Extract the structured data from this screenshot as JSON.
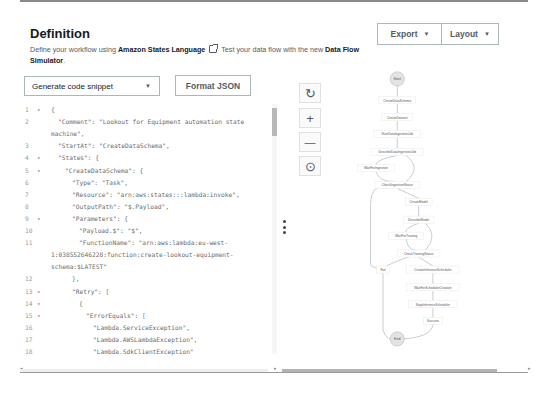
{
  "header": {
    "title": "Definition",
    "description_prefix": "Define your workflow using ",
    "description_link": "Amazon States Language",
    "description_mid": " Test your data flow with the new ",
    "description_bold2": "Data Flow Simulator",
    "description_suffix": ".",
    "export_label": "Export",
    "layout_label": "Layout"
  },
  "toolbar": {
    "snippet_select": "Generate code snippet",
    "format_json_label": "Format JSON"
  },
  "editor": {
    "lines": [
      {
        "n": "1",
        "fold": true,
        "indent": 0,
        "text": "{"
      },
      {
        "n": "2",
        "fold": false,
        "indent": 1,
        "text": "\"Comment\": \"Lookout for Equipment automation state"
      },
      {
        "n": "",
        "fold": false,
        "indent": 0,
        "text": "machine\","
      },
      {
        "n": "3",
        "fold": false,
        "indent": 1,
        "text": "\"StartAt\": \"CreateDataSchema\","
      },
      {
        "n": "4",
        "fold": true,
        "indent": 1,
        "text": "\"States\": {"
      },
      {
        "n": "5",
        "fold": true,
        "indent": 2,
        "text": "\"CreateDataSchema\": {"
      },
      {
        "n": "6",
        "fold": false,
        "indent": 3,
        "text": "\"Type\": \"Task\","
      },
      {
        "n": "7",
        "fold": false,
        "indent": 3,
        "text": "\"Resource\": \"arn:aws:states:::lambda:invoke\","
      },
      {
        "n": "8",
        "fold": false,
        "indent": 3,
        "text": "\"OutputPath\": \"$.Payload\","
      },
      {
        "n": "9",
        "fold": true,
        "indent": 3,
        "text": "\"Parameters\": {"
      },
      {
        "n": "10",
        "fold": false,
        "indent": 4,
        "text": "\"Payload.$\": \"$\","
      },
      {
        "n": "11",
        "fold": false,
        "indent": 4,
        "text": "\"FunctionName\": \"arn:aws:lambda:eu-west-"
      },
      {
        "n": "",
        "fold": false,
        "indent": 0,
        "text": "1:038552646228:function:create-lookout-equipment-"
      },
      {
        "n": "",
        "fold": false,
        "indent": 0,
        "text": "schema:$LATEST\""
      },
      {
        "n": "12",
        "fold": false,
        "indent": 3,
        "text": "},"
      },
      {
        "n": "13",
        "fold": true,
        "indent": 3,
        "text": "\"Retry\": ["
      },
      {
        "n": "14",
        "fold": true,
        "indent": 4,
        "text": "{"
      },
      {
        "n": "15",
        "fold": true,
        "indent": 5,
        "text": "\"ErrorEquals\": ["
      },
      {
        "n": "16",
        "fold": false,
        "indent": 6,
        "text": "\"Lambda.ServiceException\","
      },
      {
        "n": "17",
        "fold": false,
        "indent": 6,
        "text": "\"Lambda.AWSLambdaException\","
      },
      {
        "n": "18",
        "fold": false,
        "indent": 6,
        "text": "\"Lambda.SdkClientException\""
      },
      {
        "n": "19",
        "fold": false,
        "indent": 5,
        "text": "],"
      }
    ]
  },
  "graph_controls": {
    "refresh_icon": "↻",
    "zoom_in_icon": "+",
    "zoom_out_icon": "—",
    "center_icon": "⊙"
  },
  "graph": {
    "nodes": [
      {
        "id": "start",
        "label": "Start",
        "shape": "circle"
      },
      {
        "id": "n1",
        "label": "CreateDataSchema"
      },
      {
        "id": "n2",
        "label": "CreateDataset"
      },
      {
        "id": "n3",
        "label": "StartDataIngestionJob"
      },
      {
        "id": "n4",
        "label": "DescribeDataIngestionJob"
      },
      {
        "id": "n5",
        "label": "WaitForIngestion"
      },
      {
        "id": "n6",
        "label": "CheckIngestionStatus"
      },
      {
        "id": "n7",
        "label": "CreateModel"
      },
      {
        "id": "n8",
        "label": "DescribeModel"
      },
      {
        "id": "n9",
        "label": "WaitForTraining"
      },
      {
        "id": "n10",
        "label": "CheckTrainingStatus"
      },
      {
        "id": "fail",
        "label": "Fail"
      },
      {
        "id": "n11",
        "label": "CreateInferenceScheduler"
      },
      {
        "id": "n12",
        "label": "WaitForSchedulerCreation"
      },
      {
        "id": "n13",
        "label": "StopInferenceScheduler"
      },
      {
        "id": "n14",
        "label": "Success"
      },
      {
        "id": "end",
        "label": "End",
        "shape": "circle"
      }
    ]
  }
}
